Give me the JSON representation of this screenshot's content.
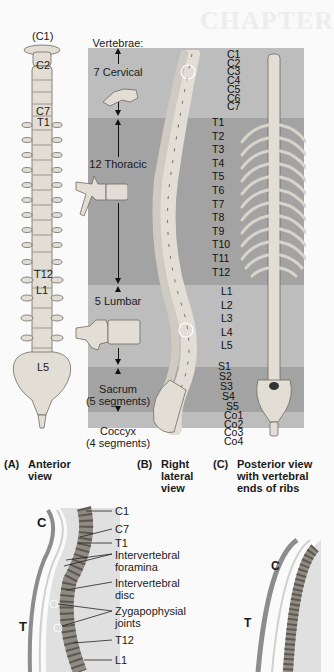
{
  "background_text": "CHAPTER",
  "colors": {
    "page_bg": "#fafafa",
    "band_light": "#bdbdbd",
    "band_dark": "#a3a3a3",
    "bone": "#e2ded6",
    "bone_stroke": "#6f6a62",
    "curve_bar": "#8c8c8c"
  },
  "anterior_labels": {
    "c1": "(C1)",
    "c2": "C2",
    "c7": "C7",
    "t1": "T1",
    "t12": "T12",
    "l1": "L1",
    "l5": "L5"
  },
  "regions": {
    "header": "Vertebrae:",
    "cervical": "7 Cervical",
    "thoracic": "12 Thoracic",
    "lumbar": "5 Lumbar",
    "sacrum_line1": "Sacrum",
    "sacrum_line2": "(5 segments)",
    "coccyx_line1": "Coccyx",
    "coccyx_line2": "(4 segments)"
  },
  "posterior_labels": [
    "C1",
    "C2",
    "C3",
    "C4",
    "C5",
    "C6",
    "C7",
    "T1",
    "T2",
    "T3",
    "T4",
    "T5",
    "T6",
    "T7",
    "T8",
    "T9",
    "T10",
    "T11",
    "T12",
    "L1",
    "L2",
    "L3",
    "L4",
    "L5",
    "S1",
    "S2",
    "S3",
    "S4",
    "S5",
    "Co1",
    "Co2",
    "Co3",
    "Co4"
  ],
  "captions": {
    "a": {
      "letter": "(A)",
      "line1": "Anterior",
      "line2": "view"
    },
    "b": {
      "letter": "(B)",
      "line1": "Right",
      "line2": "lateral",
      "line3": "view"
    },
    "c": {
      "letter": "(C)",
      "line1": "Posterior view",
      "line2": "with vertebral",
      "line3": "ends of ribs"
    }
  },
  "curvature": {
    "region_c": "C",
    "region_t": "T",
    "labels": {
      "c1": "C1",
      "c7": "C7",
      "t1": "T1",
      "foramina_1": "Intervertebral",
      "foramina_2": "foramina",
      "disc_1": "Intervertebral",
      "disc_2": "disc",
      "zyg_1": "Zygapophysial",
      "zyg_2": "joints",
      "t12": "T12",
      "l1": "L1"
    }
  }
}
